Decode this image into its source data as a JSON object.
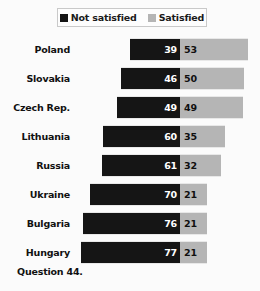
{
  "chart_data": {
    "type": "bar",
    "subtype": "diverging-stacked-bar",
    "title": "",
    "xlabel": "",
    "ylabel": "",
    "grid": false,
    "legend_position": "top",
    "axis_center_value": 0,
    "units": "percent",
    "categories": [
      "Poland",
      "Slovakia",
      "Czech Rep.",
      "Lithuania",
      "Russia",
      "Ukraine",
      "Bulgaria",
      "Hungary"
    ],
    "series": [
      {
        "name": "Not satisfied",
        "color": "#151515",
        "direction": "left",
        "values": [
          39,
          46,
          49,
          60,
          61,
          70,
          76,
          77
        ]
      },
      {
        "name": "Satisfied",
        "color": "#b5b5b5",
        "direction": "right",
        "values": [
          53,
          50,
          49,
          35,
          32,
          21,
          21,
          21
        ]
      }
    ],
    "annotations": [
      "Question 44."
    ]
  },
  "legend": {
    "items": [
      {
        "label": "Not satisfied",
        "swatch": "dark"
      },
      {
        "label": "Satisfied",
        "swatch": "light"
      }
    ]
  },
  "footnote": {
    "text": "Question 44."
  },
  "colors": {
    "background": "#fbfbfb",
    "not_satisfied": "#151515",
    "satisfied": "#b5b5b5",
    "legend_border": "#c9c9c9",
    "text": "#111111"
  }
}
